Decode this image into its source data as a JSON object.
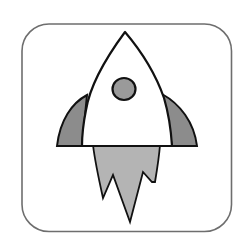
{
  "icon": {
    "name": "rocket-app-icon",
    "colors": {
      "background": "#ffffff",
      "frame_stroke": "#6e6e6e",
      "outline": "#111111",
      "body_fill": "#ffffff",
      "fin_fill": "#8c8c8c",
      "window_fill": "#9a9a9a",
      "flame_fill": "#b4b4b4"
    }
  }
}
